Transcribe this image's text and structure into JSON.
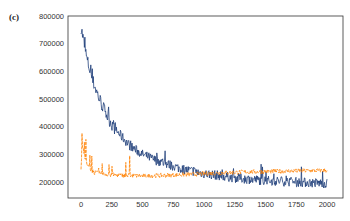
{
  "panel_label": "(c)",
  "caption": "",
  "colors": {
    "series_blue": "#1f3f7a",
    "series_orange": "#ff8000",
    "axis": "#333333"
  },
  "chart_data": {
    "type": "line",
    "title": "",
    "xlabel": "",
    "ylabel": "",
    "xlim": [
      0,
      2000
    ],
    "ylim": [
      140000,
      800000
    ],
    "grid": false,
    "legend": null,
    "x_ticks": [
      0,
      250,
      500,
      750,
      1000,
      1250,
      1500,
      1750,
      2000
    ],
    "x_tick_labels": [
      "0",
      "250",
      "500",
      "750",
      "1000",
      "1250",
      "1500",
      "1750",
      "2000"
    ],
    "y_ticks": [
      200000,
      300000,
      400000,
      500000,
      600000,
      700000,
      800000
    ],
    "y_tick_labels": [
      "200000",
      "300000",
      "400000",
      "500000",
      "600000",
      "700000",
      "800000"
    ],
    "series": [
      {
        "name": "blue (noisy decaying curve)",
        "color": "#1f3f7a",
        "x": [
          0,
          50,
          100,
          150,
          200,
          250,
          300,
          400,
          500,
          600,
          700,
          800,
          900,
          1000,
          1100,
          1250,
          1500,
          1750,
          2000
        ],
        "values": [
          760000,
          640000,
          560000,
          500000,
          450000,
          410000,
          380000,
          330000,
          300000,
          280000,
          265000,
          250000,
          240000,
          230000,
          225000,
          215000,
          205000,
          200000,
          195000
        ]
      },
      {
        "name": "orange (dashed, flat)",
        "color": "#ff8000",
        "x": [
          0,
          10,
          50,
          100,
          200,
          300,
          500,
          750,
          1000,
          1250,
          1500,
          1750,
          2000
        ],
        "values": [
          250000,
          330000,
          260000,
          235000,
          228000,
          225000,
          222000,
          225000,
          230000,
          235000,
          238000,
          240000,
          242000
        ]
      }
    ]
  }
}
